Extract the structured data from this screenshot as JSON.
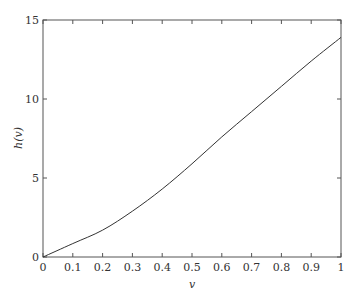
{
  "chart_data": {
    "type": "line",
    "title": "",
    "xlabel": "v",
    "ylabel": "h(v)",
    "xlim": [
      0,
      1
    ],
    "ylim": [
      0,
      15
    ],
    "x_ticks": [
      "0",
      "0.1",
      "0.2",
      "0.3",
      "0.4",
      "0.5",
      "0.6",
      "0.7",
      "0.8",
      "0.9",
      "1"
    ],
    "y_ticks": [
      "0",
      "5",
      "10",
      "15"
    ],
    "grid": false,
    "legend": null,
    "series": [
      {
        "name": "h(v)",
        "color": "#333333",
        "x": [
          0,
          0.1,
          0.2,
          0.3,
          0.4,
          0.5,
          0.6,
          0.7,
          0.8,
          0.9,
          1.0
        ],
        "y": [
          0,
          0.85,
          1.7,
          2.9,
          4.3,
          5.9,
          7.6,
          9.2,
          10.8,
          12.4,
          13.9
        ]
      }
    ]
  },
  "layout": {
    "plot_left": 43,
    "plot_right": 341,
    "plot_top": 20,
    "plot_bottom": 257
  }
}
